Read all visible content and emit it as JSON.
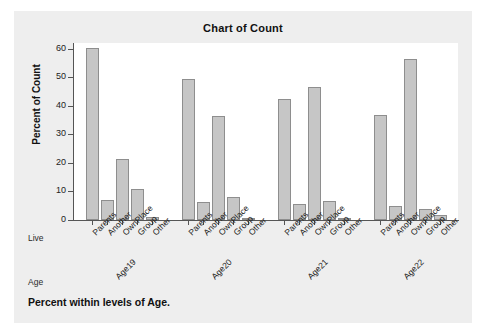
{
  "title": "Chart of Count",
  "footnote": "Percent within levels of Age.",
  "axis": {
    "y_title": "Percent of Count",
    "y_ticks": [
      "0",
      "10",
      "20",
      "30",
      "40",
      "50",
      "60"
    ],
    "row_label_live": "Live",
    "row_label_age": "Age"
  },
  "colors": {
    "bar_fill": "#c6c6c6",
    "bar_stroke": "#8e8e8e",
    "card_bg": "#eeeeee",
    "plot_bg": "#ffffff",
    "axis": "#555555",
    "text": "#111111"
  },
  "chart_data": {
    "type": "bar",
    "title": "Chart of Count",
    "xlabel": "Live / Age",
    "ylabel": "Percent of Count",
    "ylim": [
      0,
      62
    ],
    "ytick_step": 10,
    "grid": false,
    "legend": "none",
    "group_axis_name": "Age",
    "category_axis_name": "Live",
    "categories": [
      "Parents",
      "Another",
      "OwnPlace",
      "Group",
      "Other"
    ],
    "groups": [
      "Age19",
      "Age20",
      "Age21",
      "Age22"
    ],
    "series": [
      {
        "name": "Age19",
        "values": [
          60.2,
          7.0,
          21.5,
          11.0,
          1.1
        ]
      },
      {
        "name": "Age20",
        "values": [
          49.5,
          6.4,
          36.5,
          8.1,
          0.4
        ]
      },
      {
        "name": "Age21",
        "values": [
          42.3,
          5.5,
          46.7,
          6.8,
          0.8
        ]
      },
      {
        "name": "Age22",
        "values": [
          36.9,
          5.0,
          56.3,
          3.8,
          1.7
        ]
      }
    ],
    "annotation": "Percent within levels of Age."
  }
}
